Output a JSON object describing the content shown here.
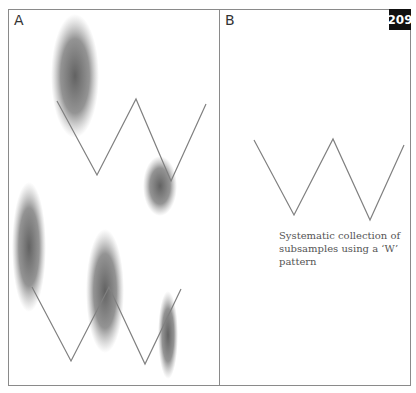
{
  "page_number": "209",
  "panels": {
    "a": {
      "label": "A"
    },
    "b": {
      "label": "B",
      "caption": "Systematic collection of subsamples using a ‘W’ pattern"
    }
  },
  "colors": {
    "line": "#808080",
    "frame": "#8a8a8a",
    "badge_bg": "#111111",
    "badge_text": "#ffffff",
    "blob": "#5a5a5a"
  }
}
